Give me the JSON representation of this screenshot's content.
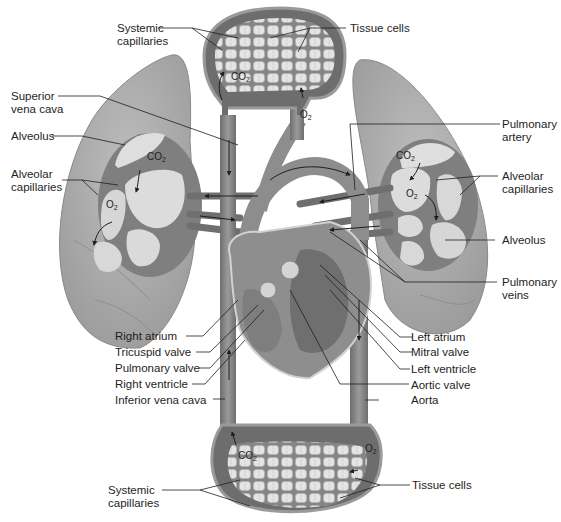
{
  "diagram": {
    "palette": {
      "background": "#ffffff",
      "lung": "#a8a8a8",
      "lung_dark": "#8c8c8c",
      "vessel": "#7a7a7a",
      "alveolus": "#dcdcdc",
      "tissue_cell": "#e6e6e6",
      "heart_muscle": "#8a8a8a",
      "line": "#1e1e1e"
    },
    "gases": {
      "co2": "CO",
      "co2_sub": "2",
      "o2": "O",
      "o2_sub": "2"
    },
    "labels": {
      "top_systemic_capillaries": "Systemic\ncapillaries",
      "top_tissue_cells": "Tissue cells",
      "superior_vena_cava": "Superior\nvena cava",
      "left_alveolus": "Alveolus",
      "left_alveolar_capillaries": "Alveolar\ncapillaries",
      "pulmonary_artery": "Pulmonary\nartery",
      "right_alveolar_capillaries": "Alveolar\ncapillaries",
      "right_alveolus": "Alveolus",
      "pulmonary_veins": "Pulmonary\nveins",
      "right_atrium": "Right atrium",
      "tricuspid_valve": "Tricuspid valve",
      "pulmonary_valve": "Pulmonary valve",
      "right_ventricle": "Right ventricle",
      "inferior_vena_cava": "Inferior vena cava",
      "left_atrium": "Left atrium",
      "mitral_valve": "Mitral valve",
      "left_ventricle": "Left ventricle",
      "aortic_valve": "Aortic valve",
      "aorta": "Aorta",
      "bottom_systemic_capillaries": "Systemic\ncapillaries",
      "bottom_tissue_cells": "Tissue cells"
    }
  }
}
